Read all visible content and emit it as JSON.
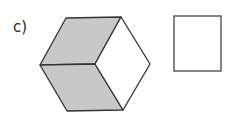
{
  "label": "c)",
  "figure": {
    "shape": "hexagon-cube",
    "shaded_faces": [
      "top-left",
      "bottom-left"
    ],
    "unshaded_face": "right",
    "shade_color": "#c8c8c8",
    "stroke_color": "#333333"
  },
  "answer_box": {
    "shape": "square",
    "content": ""
  }
}
